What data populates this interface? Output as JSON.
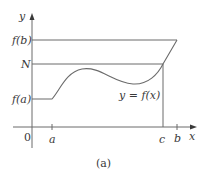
{
  "figure": {
    "caption": "(a)",
    "curve_label": "y = f(x)",
    "axes": {
      "x_label": "x",
      "y_label": "y",
      "origin_label": "0"
    },
    "x_ticks": [
      "a",
      "c",
      "b"
    ],
    "y_ticks": [
      "f(b)",
      "N",
      "f(a)"
    ],
    "colors": {
      "line": "#6b6b6b",
      "text": "#3a3a3a"
    }
  }
}
